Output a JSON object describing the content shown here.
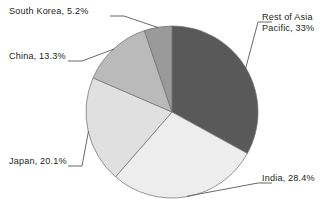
{
  "chart_data": {
    "type": "pie",
    "title": "",
    "subtitle": "",
    "xlabel": "",
    "ylabel": "",
    "legend_position": "none",
    "labels_position": "outside-with-leader-lines",
    "grid": false,
    "units": "percent",
    "total": "100%",
    "start_angle_deg": 0,
    "direction": "clockwise",
    "categories": [
      "Rest of Asia Pacific",
      "India",
      "Japan",
      "China",
      "South Korea"
    ],
    "values": [
      33,
      28.4,
      20.1,
      13.3,
      5.2
    ],
    "slices": [
      {
        "name": "Rest of Asia Pacific",
        "label": "Rest of Asia\nPacific, 33%",
        "label_line1": "Rest of Asia",
        "label_line2": "Pacific, 33%",
        "value": 33,
        "value_text": "33%",
        "color": "#59595a",
        "label_side": "right"
      },
      {
        "name": "India",
        "label": "India, 28.4%",
        "value": 28.4,
        "value_text": "28.4%",
        "color": "#ededed",
        "label_side": "right"
      },
      {
        "name": "Japan",
        "label": "Japan, 20.1%",
        "value": 20.1,
        "value_text": "20.1%",
        "color": "#e0e0e0",
        "label_side": "left"
      },
      {
        "name": "China",
        "label": "China, 13.3%",
        "value": 13.3,
        "value_text": "13.3%",
        "color": "#bababa",
        "label_side": "left"
      },
      {
        "name": "South Korea",
        "label": "South Korea, 5.2%",
        "value": 5.2,
        "value_text": "5.2%",
        "color": "#9a9a9a",
        "label_side": "left"
      }
    ],
    "colors": [
      "#59595a",
      "#ededed",
      "#e0e0e0",
      "#bababa",
      "#9a9a9a"
    ]
  },
  "caption": {
    "clipped_text": "— —— ————  ———"
  }
}
